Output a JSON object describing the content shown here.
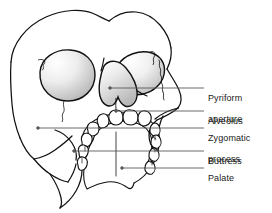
{
  "figure": {
    "style": {
      "outline_color": "#000000",
      "leader_color": "#595959",
      "text_color": "#1a1a1a",
      "shade_light": "#ffffff",
      "shade_mid": "#d8d8d8",
      "shade_dark": "#a8a8a8",
      "background": "#ffffff"
    }
  },
  "labels": [
    {
      "id": "pyriform-aperture",
      "text": "Pyriform\naperture",
      "line1": "Pyriform",
      "line2": "aperture",
      "text_x": 208,
      "text_y": 82,
      "leader": {
        "x1": 110,
        "y1": 88,
        "x2": 204,
        "y2": 88,
        "dot": true
      }
    },
    {
      "id": "alveolus",
      "text": "Alveolus",
      "line1": "Alveolus",
      "line2": "",
      "text_x": 208,
      "text_y": 105,
      "leader": {
        "x1": 116,
        "y1": 111,
        "x2": 204,
        "y2": 111,
        "dot": true
      }
    },
    {
      "id": "zygomatic-process",
      "text": "Zygomatic\nprocess",
      "line1": "Zygomatic",
      "line2": "process",
      "text_x": 208,
      "text_y": 122,
      "leader": {
        "x1": 38,
        "y1": 128,
        "x2": 204,
        "y2": 128,
        "dot": true
      }
    },
    {
      "id": "buttress",
      "text": "Buttress",
      "line1": "Buttress",
      "line2": "",
      "text_x": 208,
      "text_y": 145,
      "leader": {
        "x1": 74,
        "y1": 151,
        "x2": 204,
        "y2": 151,
        "dot": true
      }
    },
    {
      "id": "palate",
      "text": "Palate",
      "line1": "Palate",
      "line2": "",
      "text_x": 208,
      "text_y": 162,
      "leader": {
        "x1": 122,
        "y1": 168,
        "x2": 204,
        "y2": 168,
        "dot": true
      }
    }
  ]
}
